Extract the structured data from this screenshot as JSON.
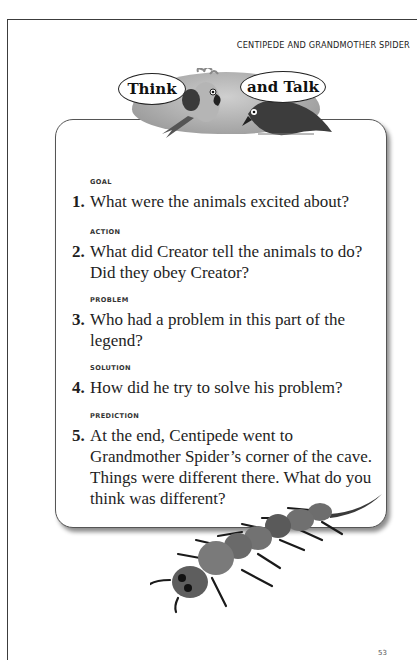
{
  "page": {
    "running_head": "CENTIPEDE AND GRANDMOTHER SPIDER",
    "page_number": "53"
  },
  "banner": {
    "bubble_left": "Think",
    "bubble_right": "and Talk",
    "icons": [
      "parrot-icon",
      "crow-icon"
    ]
  },
  "questions": [
    {
      "label": "GOAL",
      "number": "1.",
      "text": "What were the animals excited about?"
    },
    {
      "label": "ACTION",
      "number": "2.",
      "text": "What did Creator tell the animals to do? Did they obey Creator?"
    },
    {
      "label": "PROBLEM",
      "number": "3.",
      "text": "Who had a problem in this part of the legend?"
    },
    {
      "label": "SOLUTION",
      "number": "4.",
      "text": "How did he try to solve his problem?"
    },
    {
      "label": "PREDICTION",
      "number": "5.",
      "text": "At the end, Centipede went to Grandmother Spider’s corner of the cave.  Things were different there.  What do you think was different?"
    }
  ],
  "illustration": {
    "name": "centipede-illustration"
  },
  "colors": {
    "text": "#1e1e1e",
    "border": "#555555",
    "banner_gray": "#a9a9a9"
  }
}
